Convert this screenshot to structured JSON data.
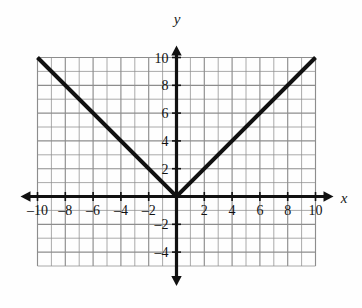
{
  "figure": {
    "kind": "cartesian-graph",
    "background": "#fefefe",
    "ink_color": "#111111",
    "grid_color": "#8d8d8d",
    "curve_color": "#111111"
  },
  "axes": {
    "x_axis_label": "x",
    "y_axis_label": "y",
    "x_ticks": [
      {
        "value": -10,
        "label": "–10"
      },
      {
        "value": -8,
        "label": "–8"
      },
      {
        "value": -6,
        "label": "–6"
      },
      {
        "value": -4,
        "label": "–4"
      },
      {
        "value": -2,
        "label": "–2"
      },
      {
        "value": 2,
        "label": "2"
      },
      {
        "value": 4,
        "label": "4"
      },
      {
        "value": 6,
        "label": "6"
      },
      {
        "value": 8,
        "label": "8"
      },
      {
        "value": 10,
        "label": "10"
      }
    ],
    "y_ticks": [
      {
        "value": 10,
        "label": "10"
      },
      {
        "value": 8,
        "label": "8"
      },
      {
        "value": 6,
        "label": "6"
      },
      {
        "value": 4,
        "label": "4"
      },
      {
        "value": 2,
        "label": "2"
      },
      {
        "value": -2,
        "label": "–2"
      },
      {
        "value": -4,
        "label": "–4"
      }
    ]
  },
  "chart_data": {
    "type": "line",
    "title": "",
    "subtitle": "",
    "xlabel": "x",
    "ylabel": "y",
    "xlim": [
      -10,
      10
    ],
    "ylim": [
      -5,
      10
    ],
    "grid": true,
    "grid_step": 1,
    "legend": null,
    "xticks": [
      -10,
      -8,
      -6,
      -4,
      -2,
      2,
      4,
      6,
      8,
      10
    ],
    "yticks": [
      10,
      8,
      6,
      4,
      2,
      -2,
      -4
    ],
    "xtick_labels": [
      "–10",
      "–8",
      "–6",
      "–4",
      "–2",
      "2",
      "4",
      "6",
      "8",
      "10"
    ],
    "ytick_labels": [
      "10",
      "8",
      "6",
      "4",
      "2",
      "–2",
      "–4"
    ],
    "series": [
      {
        "name": "y = |x|",
        "x": [
          -10,
          0,
          10
        ],
        "values": [
          10,
          0,
          10
        ],
        "style": "solid",
        "linewidth": 4,
        "color": "#111111"
      }
    ],
    "annotations": [
      {
        "text": "x",
        "role": "axis-arrow-label",
        "x": 11.1,
        "y": 0
      },
      {
        "text": "y",
        "role": "axis-arrow-label",
        "x": 0,
        "y": 11.6
      }
    ]
  }
}
